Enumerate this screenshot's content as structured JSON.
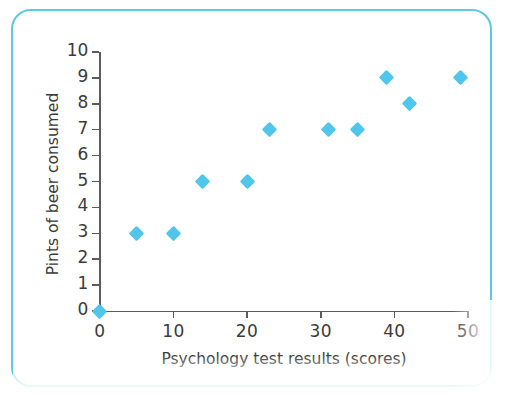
{
  "figure": {
    "frame_color": "#5cc8e8",
    "background": "#ffffff",
    "marker_color": "#4fc6ea",
    "axis_color": "#5b5b5b",
    "text_color": "#3b3b3b"
  },
  "chart_data": {
    "type": "scatter",
    "title": "",
    "xlabel": "Psychology test results (scores)",
    "ylabel": "Pints of beer consumed",
    "xlim": [
      0,
      50
    ],
    "ylim": [
      0,
      10
    ],
    "xticks": [
      0,
      10,
      20,
      30,
      40,
      50
    ],
    "yticks": [
      0,
      1,
      2,
      3,
      4,
      5,
      6,
      7,
      8,
      9,
      10
    ],
    "xtick_labels": [
      "0",
      "10",
      "20",
      "30",
      "40",
      "50"
    ],
    "ytick_labels": [
      "0",
      "1",
      "2",
      "3",
      "4",
      "5",
      "6",
      "7",
      "8",
      "9",
      "10"
    ],
    "grid": false,
    "legend": null,
    "marker": "diamond",
    "marker_color": "#4fc6ea",
    "series": [
      {
        "name": "Beer vs test score",
        "points": [
          {
            "x": 0,
            "y": 0
          },
          {
            "x": 5,
            "y": 3
          },
          {
            "x": 10,
            "y": 3
          },
          {
            "x": 14,
            "y": 5
          },
          {
            "x": 20,
            "y": 5
          },
          {
            "x": 23,
            "y": 7
          },
          {
            "x": 31,
            "y": 7
          },
          {
            "x": 35,
            "y": 7
          },
          {
            "x": 39,
            "y": 9
          },
          {
            "x": 42,
            "y": 8
          },
          {
            "x": 49,
            "y": 9
          }
        ]
      }
    ]
  }
}
